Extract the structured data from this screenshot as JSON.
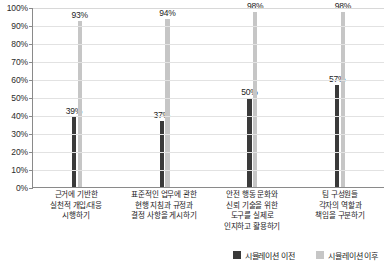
{
  "chart_data": {
    "type": "bar",
    "title": "",
    "xlabel": "",
    "ylabel": "",
    "ylim": [
      0,
      100
    ],
    "grid": true,
    "legend_position": "bottom-right",
    "categories": [
      "근거에 기반한\n실천적 개입/대응\n시행하기",
      "표준적인 업무에 관한\n현행 지침과 규정과\n결정 사항을 게시하기",
      "안전 행동 문화와\n신뢰 기술을 위한\n도구를 실제로\n인지하고 활용하기",
      "팀 구성원들\n각자의 역할과\n책임을 구분하기"
    ],
    "category_lines": [
      [
        "근거에 기반한",
        "실천적 개입/대응",
        "시행하기"
      ],
      [
        "표준적인 업무에 관한",
        "현행 지침과 규정과",
        "결정 사항을 게시하기"
      ],
      [
        "안전 행동 문화와",
        "신뢰 기술을 위한",
        "도구를 실제로",
        "인지하고 활용하기"
      ],
      [
        "팀 구성원들",
        "각자의 역할과",
        "책임을 구분하기"
      ]
    ],
    "series": [
      {
        "name": "시뮬레이션 이전",
        "color": "#3a3a3a",
        "values": [
          39,
          37,
          50,
          57
        ],
        "labels": [
          "39%",
          "37%",
          "50%",
          "57%"
        ]
      },
      {
        "name": "시뮬레이션 이후",
        "color": "#c6c6c6",
        "values": [
          93,
          94,
          98,
          98
        ],
        "labels": [
          "93%",
          "94%",
          "98%",
          "98%"
        ]
      }
    ],
    "y_ticks": [
      0,
      10,
      20,
      30,
      40,
      50,
      60,
      70,
      80,
      90,
      100
    ],
    "y_tick_labels": [
      "0%",
      "10%",
      "20%",
      "30%",
      "40%",
      "50%",
      "60%",
      "70%",
      "80%",
      "90%",
      "100%"
    ]
  },
  "legend": {
    "items": [
      {
        "label": "시뮬레이션 이전",
        "color": "#3a3a3a"
      },
      {
        "label": "시뮬레이션 이후",
        "color": "#c6c6c6"
      }
    ]
  }
}
